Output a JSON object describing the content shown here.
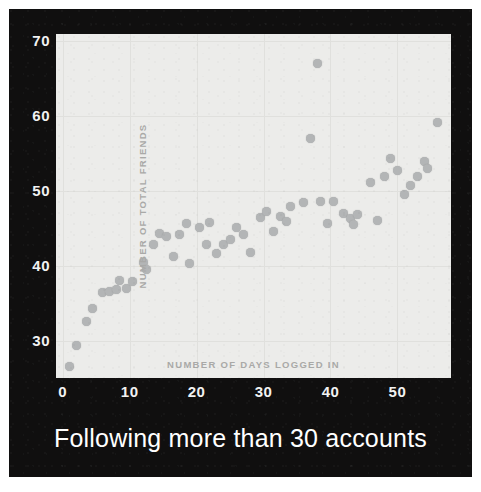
{
  "caption": "Following more than 30 accounts",
  "colors": {
    "panel_background": "#100f0f",
    "plot_background": "#ececea",
    "dot": "#b3b5b6",
    "tick_text": "#f2f2f2",
    "axis_title_text": "#a9a9a7",
    "gridline": "#e0e0dd",
    "caption_text": "#ffffff"
  },
  "chart_data": {
    "type": "scatter",
    "title": "Following more than 30 accounts",
    "xlabel": "NUMBER OF DAYS LOGGED IN",
    "ylabel": "NUMBER OF TOTAL FRIENDS",
    "xlim": [
      -1,
      58
    ],
    "ylim": [
      25,
      71
    ],
    "xticks": [
      0,
      10,
      20,
      30,
      40,
      50
    ],
    "yticks": [
      30,
      40,
      50,
      60,
      70
    ],
    "grid": true,
    "legend": null,
    "marker": "circle",
    "points": [
      [
        1,
        26.5
      ],
      [
        2,
        29.3
      ],
      [
        3.5,
        32.5
      ],
      [
        4.5,
        34.3
      ],
      [
        6,
        36.5
      ],
      [
        7,
        36.6
      ],
      [
        8,
        36.9
      ],
      [
        8.5,
        38.0
      ],
      [
        9.5,
        37.0
      ],
      [
        10.5,
        37.9
      ],
      [
        12,
        40.4
      ],
      [
        12.5,
        39.5
      ],
      [
        13.5,
        42.9
      ],
      [
        14.5,
        44.3
      ],
      [
        15.5,
        43.9
      ],
      [
        16.5,
        41.2
      ],
      [
        17.5,
        44.2
      ],
      [
        18.5,
        45.6
      ],
      [
        19,
        40.3
      ],
      [
        20.5,
        45.1
      ],
      [
        21.5,
        42.8
      ],
      [
        22,
        45.8
      ],
      [
        23,
        41.6
      ],
      [
        24,
        42.8
      ],
      [
        25,
        43.5
      ],
      [
        26,
        45.1
      ],
      [
        27,
        44.2
      ],
      [
        28,
        41.8
      ],
      [
        29.5,
        46.5
      ],
      [
        30.5,
        47.2
      ],
      [
        31.5,
        44.6
      ],
      [
        32.5,
        46.6
      ],
      [
        33.5,
        45.9
      ],
      [
        34,
        48.0
      ],
      [
        36,
        48.5
      ],
      [
        37,
        57.0
      ],
      [
        38,
        67.0
      ],
      [
        38.5,
        48.6
      ],
      [
        39.5,
        45.6
      ],
      [
        40.5,
        48.6
      ],
      [
        42,
        47.0
      ],
      [
        43,
        46.3
      ],
      [
        43.5,
        45.5
      ],
      [
        44,
        46.8
      ],
      [
        46,
        51.2
      ],
      [
        47,
        46.1
      ],
      [
        48,
        52.0
      ],
      [
        49,
        54.3
      ],
      [
        50,
        52.8
      ],
      [
        51,
        49.6
      ],
      [
        52,
        50.8
      ],
      [
        53,
        52.0
      ],
      [
        54,
        54.0
      ],
      [
        54.5,
        53.0
      ],
      [
        56,
        59.2
      ]
    ]
  }
}
